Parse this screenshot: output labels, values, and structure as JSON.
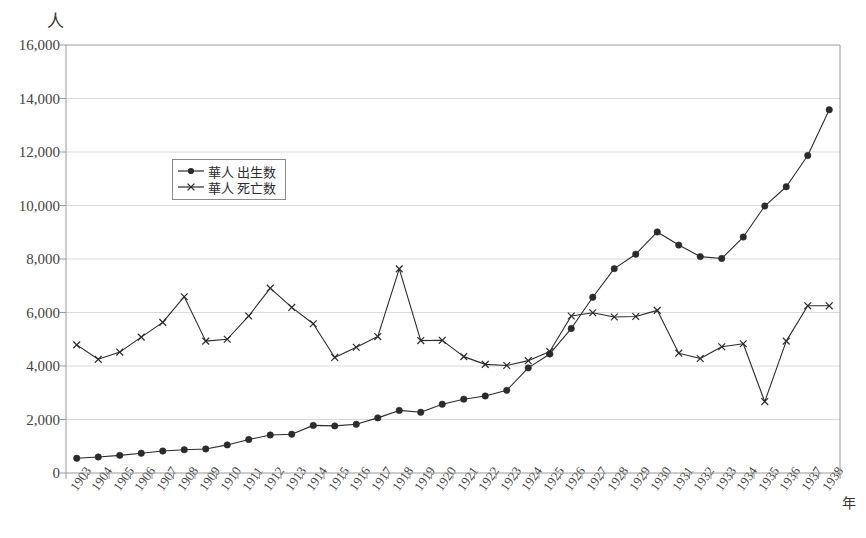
{
  "chart_data": {
    "type": "line",
    "title": "",
    "xlabel": "年",
    "ylabel": "人",
    "ylim": [
      0,
      16000
    ],
    "ytick_values": [
      0,
      2000,
      4000,
      6000,
      8000,
      10000,
      12000,
      14000,
      16000
    ],
    "ytick_labels": [
      "0",
      "2,000",
      "4,000",
      "6,000",
      "8,000",
      "10,000",
      "12,000",
      "14,000",
      "16,000"
    ],
    "grid": true,
    "legend_position": "upper-left-inside",
    "categories": [
      "1903",
      "1904",
      "1905",
      "1906",
      "1907",
      "1908",
      "1909",
      "1910",
      "1911",
      "1912",
      "1913",
      "1914",
      "1915",
      "1916",
      "1917",
      "1918",
      "1919",
      "1920",
      "1921",
      "1922",
      "1923",
      "1924",
      "1925",
      "1926",
      "1927",
      "1928",
      "1929",
      "1930",
      "1931",
      "1932",
      "1933",
      "1934",
      "1935",
      "1936",
      "1937",
      "1938"
    ],
    "series": [
      {
        "name": "華人 出生数",
        "marker": "filled-circle",
        "values": [
          550,
          600,
          660,
          740,
          820,
          870,
          900,
          1050,
          1250,
          1420,
          1450,
          1780,
          1760,
          1820,
          2060,
          2340,
          2270,
          2570,
          2760,
          2880,
          3090,
          3930,
          4450,
          5400,
          6570,
          7640,
          8180,
          9010,
          8520,
          8090,
          8020,
          8820,
          9980,
          10700,
          11870,
          13580
        ]
      },
      {
        "name": "華人 死亡数",
        "marker": "cross",
        "values": [
          4790,
          4250,
          4520,
          5080,
          5630,
          6590,
          4930,
          5000,
          5870,
          6910,
          6190,
          5580,
          4320,
          4700,
          5100,
          7630,
          4950,
          4960,
          4350,
          4060,
          4020,
          4200,
          4540,
          5870,
          5990,
          5830,
          5850,
          6080,
          4480,
          4280,
          4720,
          4830,
          2670,
          4930,
          6250,
          6250
        ]
      }
    ]
  },
  "legend": {
    "entries": [
      {
        "label": "華人 出生数"
      },
      {
        "label": "華人 死亡数"
      }
    ]
  },
  "colors": {
    "line": "#2b2b2b",
    "grid": "#d9d9d9",
    "axis": "#9a9a9a",
    "text": "#3a3a3a",
    "background": "#ffffff"
  }
}
